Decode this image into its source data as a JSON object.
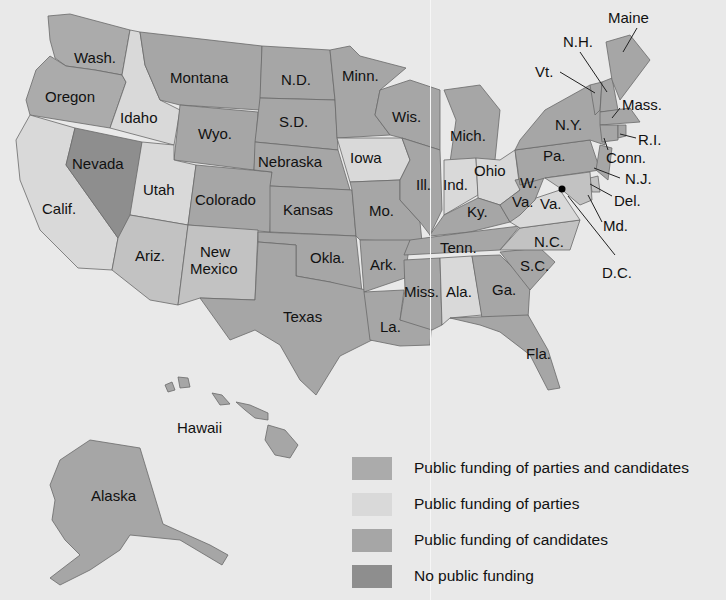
{
  "colors": {
    "background": "#e9e9e9",
    "parties_and_candidates": "#ababab",
    "parties": "#d9d9d9",
    "candidates": "#a6a6a6",
    "none": "#8e8e8e",
    "light_medium": "#c2c2c2"
  },
  "legend": [
    {
      "label": "Public funding of parties and candidates",
      "color": "#ababab"
    },
    {
      "label": "Public funding of parties",
      "color": "#d9d9d9"
    },
    {
      "label": "Public funding of candidates",
      "color": "#a6a6a6"
    },
    {
      "label": "No public funding",
      "color": "#8e8e8e"
    }
  ],
  "states": {
    "wash": "Wash.",
    "oregon": "Oregon",
    "idaho": "Idaho",
    "calif": "Calif.",
    "nevada": "Nevada",
    "montana": "Montana",
    "wyo": "Wyo.",
    "utah": "Utah",
    "colorado": "Colorado",
    "ariz": "Ariz.",
    "new": "New",
    "mexico": "Mexico",
    "nd": "N.D.",
    "sd": "S.D.",
    "nebraska": "Nebraska",
    "kansas": "Kansas",
    "okla": "Okla.",
    "texas": "Texas",
    "minn": "Minn.",
    "iowa": "Iowa",
    "mo": "Mo.",
    "ark": "Ark.",
    "la": "La.",
    "wis": "Wis.",
    "ill": "Ill.",
    "mich": "Mich.",
    "ind": "Ind.",
    "ohio": "Ohio",
    "ky": "Ky.",
    "tenn": "Tenn.",
    "miss": "Miss.",
    "ala": "Ala.",
    "ga": "Ga.",
    "fla": "Fla.",
    "sc": "S.C.",
    "nc": "N.C.",
    "va": "Va.",
    "w": "W.",
    "wva": "Va.",
    "pa": "Pa.",
    "ny": "N.Y.",
    "vt": "Vt.",
    "nh": "N.H.",
    "maine": "Maine",
    "mass": "Mass.",
    "ri": "R.I.",
    "conn": "Conn.",
    "nj": "N.J.",
    "del": "Del.",
    "md": "Md.",
    "dc": "D.C.",
    "hawaii": "Hawaii",
    "alaska": "Alaska"
  }
}
